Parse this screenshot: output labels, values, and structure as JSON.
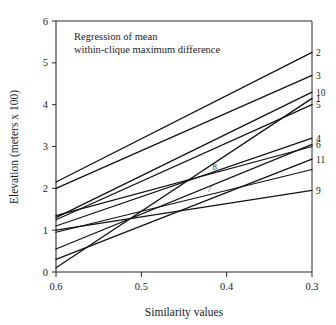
{
  "chart_data": {
    "type": "line",
    "title": "",
    "annotation": {
      "line1": "Regression of mean",
      "line2": "within-clique maximum difference"
    },
    "xlabel": "Similarity values",
    "ylabel": "Elevation (meters x 100)",
    "xlim": [
      0.6,
      0.3
    ],
    "ylim": [
      0,
      6
    ],
    "x_reversed": true,
    "xticks": [
      "0.6",
      "0.5",
      "0.4",
      "0.3"
    ],
    "xtick_values": [
      0.6,
      0.5,
      0.4,
      0.3
    ],
    "yticks": [
      "0",
      "1",
      "2",
      "3",
      "4",
      "5",
      "6"
    ],
    "ytick_values": [
      0,
      1,
      2,
      3,
      4,
      5,
      6
    ],
    "grid": false,
    "legend_position": "inline-right-end-labels",
    "x": [
      0.6,
      0.3
    ],
    "series": [
      {
        "name": "2",
        "label": "2",
        "values": [
          2.15,
          5.25
        ],
        "label_side": "right"
      },
      {
        "name": "3",
        "label": "3",
        "values": [
          2.0,
          4.7
        ],
        "label_side": "right"
      },
      {
        "name": "10",
        "label": "10",
        "values": [
          1.3,
          4.3
        ],
        "label_side": "right"
      },
      {
        "name": "1",
        "label": "1",
        "values": [
          0.1,
          4.15
        ],
        "label_side": "right"
      },
      {
        "name": "5",
        "label": "5",
        "values": [
          1.25,
          4.0
        ],
        "label_side": "right"
      },
      {
        "name": "4",
        "label": "4",
        "values": [
          1.1,
          3.2
        ],
        "label_side": "right"
      },
      {
        "name": "6",
        "label": "6",
        "values": [
          0.55,
          3.05
        ],
        "label_side": "right"
      },
      {
        "name": "8",
        "label": "8",
        "values": [
          1.35,
          3.0
        ],
        "label_side": "inline"
      },
      {
        "name": "11",
        "label": "11",
        "values": [
          0.3,
          2.7
        ],
        "label_side": "right"
      },
      {
        "name": "7",
        "label": "7",
        "values": [
          0.95,
          2.45
        ],
        "label_side": "inline"
      },
      {
        "name": "9",
        "label": "9",
        "values": [
          1.0,
          1.95
        ],
        "label_side": "right"
      }
    ],
    "colors": {
      "line": "#111111",
      "axis": "#2a2a2a",
      "text": "#1a1a1a",
      "background": "#ffffff"
    }
  }
}
